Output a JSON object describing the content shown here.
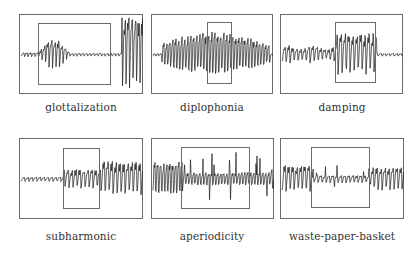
{
  "figure": {
    "panels": [
      {
        "id": "glottalization",
        "label": "glottalization",
        "box": [
          19,
          14,
          124,
          80
        ],
        "inner": [
          38,
          23,
          73,
          62
        ]
      },
      {
        "id": "diplophonia",
        "label": "diplophonia",
        "box": [
          151,
          14,
          122,
          80
        ],
        "inner": [
          207,
          22,
          25,
          62
        ]
      },
      {
        "id": "damping",
        "label": "damping",
        "box": [
          280,
          14,
          123,
          80
        ],
        "inner": [
          335,
          22,
          41,
          61
        ]
      },
      {
        "id": "subharmonic",
        "label": "subharmonic",
        "box": [
          19,
          138,
          124,
          81
        ],
        "inner": [
          63,
          148,
          37,
          61
        ]
      },
      {
        "id": "aperiodicity",
        "label": "aperiodicity",
        "box": [
          151,
          138,
          123,
          81
        ],
        "inner": [
          181,
          147,
          69,
          62
        ]
      },
      {
        "id": "waste-paper-basket",
        "label": "waste-paper-basket",
        "box": [
          280,
          138,
          124,
          81
        ],
        "inner": [
          311,
          147,
          59,
          61
        ]
      }
    ]
  },
  "labels": {
    "p0": "glottalization",
    "p1": "diplophonia",
    "p2": "damping",
    "p3": "subharmonic",
    "p4": "aperiodicity",
    "p5": "waste-paper-basket"
  },
  "colors": {
    "frame": "#6a6a6a",
    "wave": "#1a1a1a",
    "text": "#333333"
  }
}
